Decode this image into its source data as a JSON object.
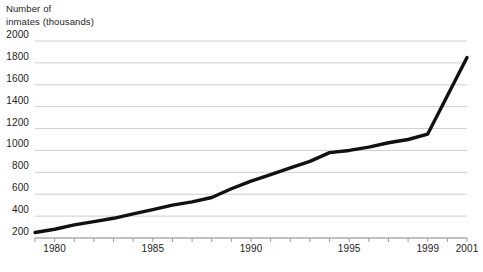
{
  "figure": {
    "axis_title_line1": "Number of",
    "axis_title_line2": "inmates (thousands)",
    "axis_title": "Number of\ninmates (thousands)",
    "line_color": "#111111",
    "grid_color": "#cfcfcf",
    "axis_color": "#9a9a9a",
    "background": "#ffffff"
  },
  "chart_data": {
    "type": "line",
    "title": "",
    "subtitle": "",
    "xlabel": "",
    "ylabel": "Number of inmates (thousands)",
    "ylim": [
      200,
      2000
    ],
    "xlim": [
      1979,
      2001
    ],
    "grid": true,
    "legend": "none",
    "y_ticks": [
      200,
      400,
      600,
      800,
      1000,
      1200,
      1400,
      1600,
      1800,
      2000
    ],
    "x_ticks": [
      1980,
      1985,
      1990,
      1995,
      1999,
      2001
    ],
    "x_tick_labels": [
      "1980",
      "1985",
      "1990",
      "1995",
      "1999",
      "2001"
    ],
    "x_minor_ticks": [
      1979,
      1980,
      1981,
      1982,
      1983,
      1984,
      1985,
      1986,
      1987,
      1988,
      1989,
      1990,
      1991,
      1992,
      1993,
      1994,
      1995,
      1996,
      1997,
      1998,
      1999,
      2000,
      2001
    ],
    "series": [
      {
        "name": "Number of inmates",
        "x": [
          1979,
          1980,
          1981,
          1982,
          1983,
          1984,
          1985,
          1986,
          1987,
          1988,
          1989,
          1990,
          1991,
          1992,
          1993,
          1994,
          1995,
          1996,
          1997,
          1998,
          1999,
          2000,
          2001
        ],
        "values": [
          250,
          280,
          320,
          350,
          380,
          420,
          460,
          500,
          530,
          570,
          650,
          720,
          780,
          840,
          900,
          980,
          1000,
          1030,
          1070,
          1100,
          1150,
          1500,
          1850
        ]
      }
    ]
  }
}
